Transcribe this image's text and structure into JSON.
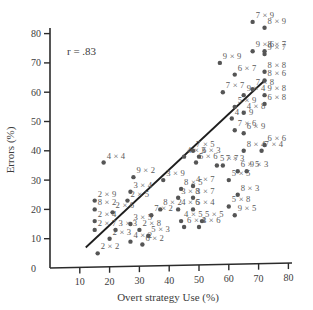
{
  "chart_data": {
    "type": "scatter",
    "title": "",
    "xlabel": "Overt strategy Use (%)",
    "ylabel": "Errors (%)",
    "xlim": [
      0,
      80
    ],
    "ylim": [
      0,
      80
    ],
    "x_ticks": [
      10,
      20,
      30,
      40,
      50,
      60,
      70,
      80
    ],
    "y_ticks": [
      0,
      10,
      20,
      30,
      40,
      50,
      60,
      70,
      80
    ],
    "grid": false,
    "legend": null,
    "annotation": "r = .83",
    "regression_line": {
      "x1": 12,
      "y1": 7,
      "x2": 72,
      "y2": 64
    },
    "points": [
      {
        "label": "7 × 9",
        "x": 68,
        "y": 84
      },
      {
        "label": "8 × 9",
        "x": 72,
        "y": 82
      },
      {
        "label": "9 × 6",
        "x": 68,
        "y": 74
      },
      {
        "label": "8 × 7",
        "x": 72,
        "y": 74
      },
      {
        "label": "9 × 7",
        "x": 72,
        "y": 73
      },
      {
        "label": "9 × 9",
        "x": 57,
        "y": 70
      },
      {
        "label": "6 × 7",
        "x": 62,
        "y": 66
      },
      {
        "label": "8 × 8",
        "x": 72,
        "y": 67
      },
      {
        "label": "8 × 6",
        "x": 72,
        "y": 64
      },
      {
        "label": "7 × 7",
        "x": 58,
        "y": 60
      },
      {
        "label": "7 × 8",
        "x": 68,
        "y": 61
      },
      {
        "label": "9 × 4",
        "x": 65,
        "y": 59
      },
      {
        "label": "9 × 8",
        "x": 72,
        "y": 59
      },
      {
        "label": "5 × 9",
        "x": 62,
        "y": 55
      },
      {
        "label": "6 × 8",
        "x": 72,
        "y": 56
      },
      {
        "label": "4 × 8",
        "x": 65,
        "y": 53
      },
      {
        "label": "4 × 9",
        "x": 61,
        "y": 51
      },
      {
        "label": "7 × 6",
        "x": 62,
        "y": 47
      },
      {
        "label": "6 × 9",
        "x": 65,
        "y": 46
      },
      {
        "label": "6 × 6",
        "x": 72,
        "y": 42
      },
      {
        "label": "7 × 4",
        "x": 71,
        "y": 40
      },
      {
        "label": "8 × 4",
        "x": 65,
        "y": 40
      },
      {
        "label": "7 × 5",
        "x": 48,
        "y": 40
      },
      {
        "label": "4 × 3",
        "x": 45,
        "y": 38
      },
      {
        "label": "6 × 3",
        "x": 50,
        "y": 38
      },
      {
        "label": "4 × 4",
        "x": 18,
        "y": 36
      },
      {
        "label": "5 × 6",
        "x": 49,
        "y": 36
      },
      {
        "label": "5 × 7",
        "x": 56,
        "y": 35
      },
      {
        "label": "7 × 3",
        "x": 58,
        "y": 35
      },
      {
        "label": "9 × 2",
        "x": 28,
        "y": 31
      },
      {
        "label": "3 × 9",
        "x": 38,
        "y": 30
      },
      {
        "label": "6 × 5",
        "x": 63,
        "y": 33
      },
      {
        "label": "9 × 3",
        "x": 66,
        "y": 33
      },
      {
        "label": "5 × 5",
        "x": 60,
        "y": 30
      },
      {
        "label": "3 × 4",
        "x": 27,
        "y": 26
      },
      {
        "label": "8 × 5",
        "x": 44,
        "y": 27
      },
      {
        "label": "4 × 7",
        "x": 48,
        "y": 28
      },
      {
        "label": "8 × 3",
        "x": 63,
        "y": 25
      },
      {
        "label": "3 × 8",
        "x": 43,
        "y": 24
      },
      {
        "label": "3 × 7",
        "x": 48,
        "y": 24
      },
      {
        "label": "5 × 8",
        "x": 60,
        "y": 21
      },
      {
        "label": "2 × 5",
        "x": 26,
        "y": 23
      },
      {
        "label": "2 × 9",
        "x": 15,
        "y": 23
      },
      {
        "label": "4 × 6",
        "x": 43,
        "y": 20
      },
      {
        "label": "5 × 4",
        "x": 48,
        "y": 20
      },
      {
        "label": "9 × 5",
        "x": 62,
        "y": 18
      },
      {
        "label": "2 × 6",
        "x": 21,
        "y": 19
      },
      {
        "label": "8 × 2",
        "x": 37,
        "y": 20
      },
      {
        "label": "7 × 2",
        "x": 34,
        "y": 18
      },
      {
        "label": "8 × 2",
        "x": 15,
        "y": 20
      },
      {
        "label": "4 × 5",
        "x": 44,
        "y": 16
      },
      {
        "label": "5 × 5",
        "x": 51,
        "y": 16
      },
      {
        "label": "2 × 4",
        "x": 15,
        "y": 16
      },
      {
        "label": "3 × 5",
        "x": 27,
        "y": 15
      },
      {
        "label": "6 × 4",
        "x": 45,
        "y": 14
      },
      {
        "label": "3 × 6",
        "x": 50,
        "y": 14
      },
      {
        "label": "2 × 7",
        "x": 15,
        "y": 13
      },
      {
        "label": "3 × 3",
        "x": 22,
        "y": 13
      },
      {
        "label": "2 × 8",
        "x": 30,
        "y": 13
      },
      {
        "label": "5 × 3",
        "x": 33,
        "y": 11
      },
      {
        "label": "2 × 3",
        "x": 20,
        "y": 10
      },
      {
        "label": "4 × 2",
        "x": 27,
        "y": 9
      },
      {
        "label": "6 × 2",
        "x": 31,
        "y": 8
      },
      {
        "label": "2 × 2",
        "x": 16,
        "y": 5
      }
    ]
  },
  "labels": {
    "r_annotation": "r = .83",
    "x_axis_title": "Overt strategy Use (%)",
    "y_axis_title": "Errors (%)",
    "x_ticks": [
      "10",
      "20",
      "30",
      "40",
      "50",
      "60",
      "70",
      "80"
    ],
    "y_ticks": [
      "0",
      "10",
      "20",
      "30",
      "40",
      "50",
      "60",
      "70",
      "80"
    ]
  }
}
